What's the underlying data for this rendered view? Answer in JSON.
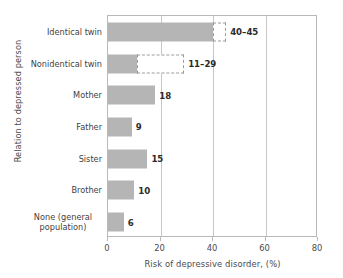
{
  "chart_data": {
    "type": "bar",
    "orientation": "horizontal",
    "title": "",
    "xlabel": "Risk of depressive disorder, (%)",
    "ylabel": "Relation to depressed person",
    "xlim": [
      0,
      80
    ],
    "xticks": [
      0,
      20,
      40,
      60,
      80
    ],
    "xticklabels": [
      "0",
      "20",
      "40",
      "60",
      "80"
    ],
    "grid": true,
    "legend": "none",
    "categories": [
      "Identical twin",
      "Nonidentical twin",
      "Mother",
      "Father",
      "Sister",
      "Brother",
      "None (general population)"
    ],
    "bars": [
      {
        "category": "Identical twin",
        "value_low": 40,
        "value_high": 45,
        "is_range": true,
        "label": "40–45",
        "solid_to": 40,
        "range_to": 45
      },
      {
        "category": "Nonidentical twin",
        "value_low": 11,
        "value_high": 29,
        "is_range": true,
        "label": "11–29",
        "solid_to": 11,
        "range_to": 29
      },
      {
        "category": "Mother",
        "value_low": 18,
        "value_high": 18,
        "is_range": false,
        "label": "18",
        "solid_to": 18,
        "range_to": 18
      },
      {
        "category": "Father",
        "value_low": 9,
        "value_high": 9,
        "is_range": false,
        "label": "9",
        "solid_to": 9,
        "range_to": 9
      },
      {
        "category": "Sister",
        "value_low": 15,
        "value_high": 15,
        "is_range": false,
        "label": "15",
        "solid_to": 15,
        "range_to": 15
      },
      {
        "category": "Brother",
        "value_low": 10,
        "value_high": 10,
        "is_range": false,
        "label": "10",
        "solid_to": 10,
        "range_to": 10
      },
      {
        "category": "None (general population)",
        "value_low": 6,
        "value_high": 6,
        "is_range": false,
        "label": "6",
        "solid_to": 6,
        "range_to": 6
      }
    ],
    "colors": {
      "bar_fill": "#b5b5b5",
      "range_fill": "#ffffff",
      "range_border": "#9a9a9a",
      "axis": "#b9b9b9",
      "grid": "#c6c6c6",
      "text": "#3a3a3a"
    }
  }
}
